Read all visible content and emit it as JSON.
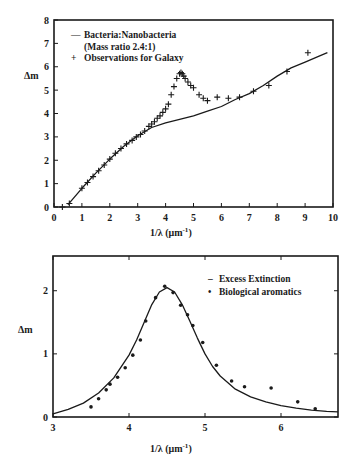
{
  "chart_data": [
    {
      "type": "line",
      "title": "",
      "xlabel": "1/λ (μm⁻¹)",
      "ylabel": "Δm",
      "xlim": [
        0,
        10
      ],
      "ylim": [
        0,
        8
      ],
      "x_ticks": [
        0,
        1,
        2,
        3,
        4,
        5,
        6,
        7,
        8,
        9,
        10
      ],
      "y_ticks": [
        0,
        1,
        2,
        3,
        4,
        5,
        6,
        7,
        8
      ],
      "grid": false,
      "legend_position": "upper-left",
      "legend": [
        {
          "marker": "line",
          "label": "Bacteria:Nanobacteria"
        },
        {
          "marker": "none",
          "label": "(Mass ratio 2.4:1)"
        },
        {
          "marker": "plus",
          "label": "Observations for Galaxy"
        }
      ],
      "series": [
        {
          "name": "Bacteria:Nanobacteria (Mass ratio 2.4:1)",
          "style": "line",
          "x": [
            0.5,
            1.0,
            1.5,
            2.0,
            2.5,
            3.0,
            3.5,
            4.0,
            4.5,
            5.0,
            5.5,
            6.0,
            6.5,
            7.0,
            7.5,
            8.0,
            8.5,
            9.0,
            9.5,
            9.8
          ],
          "y": [
            0.1,
            0.8,
            1.45,
            2.05,
            2.6,
            3.05,
            3.4,
            3.6,
            3.75,
            3.9,
            4.1,
            4.3,
            4.6,
            4.85,
            5.2,
            5.6,
            5.95,
            6.2,
            6.45,
            6.6
          ]
        },
        {
          "name": "Observations for Galaxy",
          "style": "plus",
          "x": [
            0.3,
            0.55,
            1.0,
            1.2,
            1.4,
            1.6,
            1.8,
            2.0,
            2.2,
            2.4,
            2.6,
            2.8,
            2.95,
            3.1,
            3.25,
            3.4,
            3.5,
            3.6,
            3.7,
            3.8,
            3.9,
            4.0,
            4.1,
            4.2,
            4.3,
            4.4,
            4.5,
            4.55,
            4.6,
            4.65,
            4.7,
            4.8,
            4.9,
            5.0,
            5.2,
            5.35,
            5.5,
            5.85,
            6.25,
            6.65,
            7.15,
            7.7,
            8.35,
            9.1
          ],
          "y": [
            0.0,
            0.15,
            0.8,
            1.05,
            1.3,
            1.55,
            1.8,
            2.05,
            2.3,
            2.5,
            2.7,
            2.85,
            3.0,
            3.1,
            3.25,
            3.45,
            3.55,
            3.65,
            3.8,
            3.9,
            4.05,
            4.2,
            4.4,
            4.8,
            5.15,
            5.5,
            5.7,
            5.75,
            5.7,
            5.6,
            5.5,
            5.35,
            5.2,
            5.1,
            4.8,
            4.65,
            4.55,
            4.7,
            4.65,
            4.7,
            4.95,
            5.2,
            5.8,
            6.6
          ]
        }
      ]
    },
    {
      "type": "line",
      "title": "",
      "xlabel": "1/λ (μm⁻¹)",
      "ylabel": "Δm",
      "xlim": [
        3,
        6.75
      ],
      "ylim": [
        0,
        2.55
      ],
      "x_ticks": [
        3,
        4,
        5,
        6
      ],
      "y_ticks": [
        0,
        1,
        2
      ],
      "grid": false,
      "legend_position": "upper-right",
      "legend": [
        {
          "marker": "line",
          "label": "Excess Extinction"
        },
        {
          "marker": "dot",
          "label": "Biological aromatics"
        }
      ],
      "series": [
        {
          "name": "Excess Extinction",
          "style": "line",
          "x": [
            3.0,
            3.2,
            3.4,
            3.6,
            3.8,
            4.0,
            4.1,
            4.2,
            4.3,
            4.4,
            4.5,
            4.6,
            4.7,
            4.8,
            4.9,
            5.0,
            5.1,
            5.2,
            5.4,
            5.6,
            5.8,
            6.0,
            6.2,
            6.4,
            6.6,
            6.75
          ],
          "y": [
            0.05,
            0.12,
            0.22,
            0.38,
            0.62,
            0.98,
            1.22,
            1.5,
            1.78,
            1.98,
            2.05,
            1.98,
            1.78,
            1.52,
            1.25,
            1.0,
            0.8,
            0.65,
            0.44,
            0.32,
            0.24,
            0.18,
            0.14,
            0.11,
            0.09,
            0.08
          ]
        },
        {
          "name": "Biological aromatics",
          "style": "dot",
          "x": [
            3.5,
            3.6,
            3.7,
            3.75,
            3.85,
            3.95,
            4.05,
            4.15,
            4.22,
            4.35,
            4.47,
            4.58,
            4.68,
            4.77,
            4.84,
            4.97,
            5.15,
            5.35,
            5.52,
            5.87,
            6.22,
            6.45
          ],
          "y": [
            0.16,
            0.29,
            0.43,
            0.52,
            0.63,
            0.78,
            0.98,
            1.22,
            1.52,
            1.89,
            2.07,
            1.97,
            1.77,
            1.62,
            1.45,
            1.18,
            0.82,
            0.57,
            0.48,
            0.46,
            0.24,
            0.13
          ]
        }
      ]
    }
  ],
  "top_chart": {
    "ylabel": "Δm",
    "xlabel_main": "1/λ (μm",
    "xlabel_sup": "-1",
    "xlabel_end": ")",
    "legend": {
      "line_label": "Bacteria:Nanobacteria",
      "line_sub": "(Mass ratio 2.4:1)",
      "plus_label": "Observations for Galaxy",
      "line_glyph": "—",
      "plus_glyph": "+"
    }
  },
  "bottom_chart": {
    "ylabel": "Δm",
    "xlabel_main": "1/λ (μm",
    "xlabel_sup": "-1",
    "xlabel_end": ")",
    "legend": {
      "line_label": "Excess Extinction",
      "dot_label": "Biological aromatics",
      "line_glyph": "–",
      "dot_glyph": "•"
    }
  },
  "colors": {
    "ink": "#1a1a1a",
    "background": "#ffffff"
  }
}
